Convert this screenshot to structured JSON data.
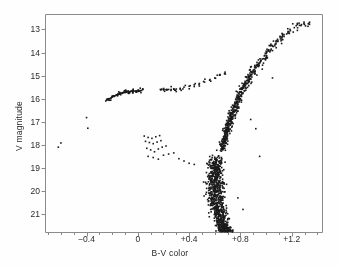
{
  "figure": {
    "background_color": "#fefefe",
    "frame_color": "#8a8a8a",
    "point_color": "#1a1a1a"
  },
  "chart_data": {
    "type": "scatter",
    "title": "",
    "xlabel": "B-V color",
    "ylabel": "V magnitude",
    "xlim": [
      -0.72,
      1.44
    ],
    "ylim": [
      21.8,
      12.35
    ],
    "y_inverted": true,
    "grid": false,
    "legend": null,
    "x_ticks": [
      -0.4,
      0,
      0.4,
      0.8,
      1.2
    ],
    "x_tick_labels": [
      "−0.4",
      "0",
      "+0.4",
      "+0.8",
      "+1.2"
    ],
    "x_minor_tick_step": 0.1,
    "y_ticks": [
      13,
      14,
      15,
      16,
      17,
      18,
      19,
      20,
      21
    ],
    "y_tick_labels": [
      "13",
      "14",
      "15",
      "16",
      "17",
      "18",
      "19",
      "20",
      "21"
    ],
    "point_marker": "square",
    "point_size_px": 1.6,
    "n_points_approx": 1050,
    "series": [
      {
        "name": "Red giant branch",
        "x": [
          1.33,
          1.3,
          1.26,
          1.22,
          1.19,
          1.17,
          1.14,
          1.12,
          1.13,
          1.09,
          1.07,
          1.05,
          1.04,
          1.02,
          1.0,
          0.99,
          1.01,
          0.97,
          0.96,
          0.95,
          0.93,
          0.94,
          0.92,
          0.91,
          0.9,
          0.89,
          0.91,
          0.88,
          0.87,
          0.87,
          0.86,
          0.85,
          0.86,
          0.84,
          0.83,
          0.84,
          0.82,
          0.82,
          0.81,
          0.83,
          0.8,
          0.81,
          0.79,
          0.8,
          0.78,
          0.79,
          0.8,
          0.77,
          0.78,
          0.76,
          0.77,
          0.78,
          0.75,
          0.76,
          0.77,
          0.74,
          0.75,
          0.76,
          0.74,
          0.75,
          0.73,
          0.74,
          0.75,
          0.72,
          0.73,
          0.74,
          0.72,
          0.73,
          0.71,
          0.72,
          0.73,
          0.7,
          0.71,
          0.72,
          0.7,
          0.71,
          0.69,
          0.7,
          0.71,
          0.69,
          0.7,
          0.68,
          0.69,
          0.7,
          0.68,
          0.69,
          0.67,
          0.68,
          0.69,
          0.67,
          0.68,
          0.66,
          0.67,
          0.68,
          0.66,
          0.67,
          0.65,
          0.66,
          0.67,
          0.65
        ],
        "y": [
          12.75,
          12.78,
          12.82,
          12.92,
          13.05,
          13.15,
          13.22,
          13.35,
          13.44,
          13.52,
          13.64,
          13.72,
          13.85,
          13.93,
          14.05,
          14.12,
          14.22,
          14.28,
          14.36,
          14.45,
          14.52,
          14.6,
          14.66,
          14.72,
          14.8,
          14.86,
          14.92,
          14.98,
          15.04,
          15.1,
          15.16,
          15.22,
          15.28,
          15.33,
          15.38,
          15.44,
          15.5,
          15.55,
          15.6,
          15.65,
          15.7,
          15.75,
          15.8,
          15.85,
          15.9,
          15.95,
          16.0,
          16.05,
          16.1,
          16.15,
          16.2,
          16.25,
          16.3,
          16.34,
          16.38,
          16.42,
          16.46,
          16.5,
          16.54,
          16.58,
          16.62,
          16.66,
          16.7,
          16.74,
          16.78,
          16.82,
          16.86,
          16.9,
          16.94,
          16.98,
          17.02,
          17.06,
          17.1,
          17.14,
          17.18,
          17.22,
          17.26,
          17.3,
          17.34,
          17.38,
          17.42,
          17.46,
          17.5,
          17.54,
          17.58,
          17.62,
          17.66,
          17.7,
          17.74,
          17.78,
          17.82,
          17.86,
          17.9,
          17.94,
          17.98,
          18.02,
          18.06,
          18.1,
          18.14,
          18.18
        ]
      },
      {
        "name": "Main sequence",
        "x": [
          0.62,
          0.6,
          0.61,
          0.63,
          0.59,
          0.6,
          0.62,
          0.58,
          0.61,
          0.63,
          0.59,
          0.6,
          0.62,
          0.64,
          0.57,
          0.59,
          0.61,
          0.63,
          0.58,
          0.6,
          0.62,
          0.64,
          0.57,
          0.59,
          0.61,
          0.63,
          0.65,
          0.56,
          0.58,
          0.6,
          0.62,
          0.64,
          0.57,
          0.59,
          0.61,
          0.63,
          0.65,
          0.56,
          0.58,
          0.6,
          0.62,
          0.64,
          0.66,
          0.57,
          0.59,
          0.61,
          0.63,
          0.65,
          0.58,
          0.6,
          0.62,
          0.64,
          0.66,
          0.59,
          0.61,
          0.63,
          0.65,
          0.67,
          0.6,
          0.62,
          0.64,
          0.66,
          0.68,
          0.61,
          0.63,
          0.65,
          0.67,
          0.62,
          0.64,
          0.66,
          0.68,
          0.63,
          0.65,
          0.67,
          0.69,
          0.64,
          0.66,
          0.68,
          0.7,
          0.65,
          0.67,
          0.69,
          0.71,
          0.66,
          0.68,
          0.7,
          0.72
        ],
        "y": [
          18.55,
          18.62,
          18.68,
          18.72,
          18.78,
          18.82,
          18.86,
          18.9,
          18.94,
          18.98,
          19.02,
          19.06,
          19.1,
          19.14,
          19.18,
          19.22,
          19.26,
          19.3,
          19.34,
          19.38,
          19.42,
          19.46,
          19.5,
          19.54,
          19.58,
          19.62,
          19.66,
          19.7,
          19.74,
          19.78,
          19.82,
          19.86,
          19.9,
          19.94,
          19.98,
          20.02,
          20.06,
          20.1,
          20.14,
          20.18,
          20.22,
          20.26,
          20.3,
          20.34,
          20.38,
          20.42,
          20.46,
          20.5,
          20.54,
          20.58,
          20.62,
          20.66,
          20.7,
          20.74,
          20.78,
          20.82,
          20.86,
          20.9,
          20.94,
          20.98,
          21.02,
          21.06,
          21.1,
          21.14,
          21.18,
          21.22,
          21.26,
          21.3,
          21.34,
          21.38,
          21.42,
          21.46,
          21.5,
          21.54,
          21.58,
          21.6,
          21.62,
          21.64,
          21.66,
          21.68,
          21.7,
          21.72,
          21.74,
          21.76,
          21.78,
          21.79,
          21.8
        ]
      },
      {
        "name": "Horizontal branch",
        "x": [
          -0.25,
          -0.23,
          -0.22,
          -0.21,
          -0.2,
          -0.19,
          -0.18,
          -0.17,
          -0.16,
          -0.15,
          -0.14,
          -0.13,
          -0.12,
          -0.11,
          -0.1,
          -0.09,
          -0.08,
          -0.07,
          -0.06,
          -0.05,
          -0.04,
          -0.03,
          -0.02,
          -0.01,
          0.0,
          0.01,
          0.02,
          0.03,
          0.18,
          0.2,
          0.22,
          0.24,
          0.26,
          0.28,
          0.3,
          0.33,
          0.36,
          0.4,
          0.44,
          0.48,
          0.52,
          0.56,
          0.6,
          0.64,
          0.68
        ],
        "y": [
          16.1,
          16.05,
          16.0,
          15.97,
          15.93,
          15.9,
          15.88,
          15.85,
          15.83,
          15.8,
          15.78,
          15.76,
          15.74,
          15.73,
          15.72,
          15.71,
          15.7,
          15.7,
          15.69,
          15.68,
          15.68,
          15.67,
          15.67,
          15.66,
          15.66,
          15.65,
          15.65,
          15.64,
          15.62,
          15.62,
          15.61,
          15.6,
          15.6,
          15.59,
          15.58,
          15.55,
          15.5,
          15.46,
          15.4,
          15.34,
          15.28,
          15.2,
          15.1,
          14.98,
          14.85
        ]
      },
      {
        "name": "Blue stragglers and field stars",
        "x": [
          -0.62,
          -0.6,
          -0.4,
          -0.39,
          0.05,
          0.08,
          0.11,
          0.14,
          0.17,
          0.06,
          0.09,
          0.12,
          0.15,
          0.18,
          0.07,
          0.1,
          0.13,
          0.16,
          0.19,
          0.22,
          0.08,
          0.12,
          0.16,
          0.2,
          0.24,
          0.28,
          0.32,
          0.36,
          0.4,
          0.44,
          0.88,
          0.92,
          0.95,
          0.84,
          1.05,
          0.78,
          0.82
        ],
        "y": [
          18.1,
          17.92,
          16.82,
          17.28,
          17.62,
          17.68,
          17.72,
          17.65,
          17.6,
          17.85,
          17.9,
          17.95,
          17.88,
          17.82,
          18.15,
          18.22,
          18.3,
          18.18,
          18.1,
          18.05,
          18.5,
          18.55,
          18.62,
          18.45,
          18.4,
          18.35,
          18.6,
          18.7,
          18.8,
          18.85,
          16.9,
          17.3,
          18.5,
          15.05,
          15.1,
          20.3,
          20.8
        ]
      }
    ]
  }
}
